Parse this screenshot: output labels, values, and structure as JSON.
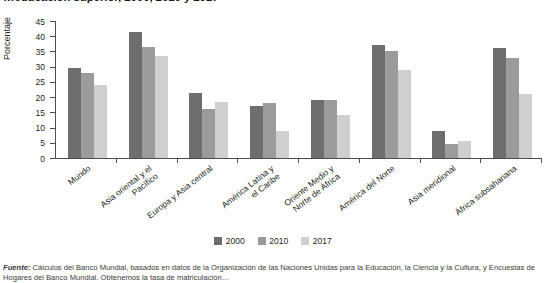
{
  "figure": {
    "title_clipped": "…educación superior, 2000, 2010 y 2017",
    "ylabel": "Porcentaje"
  },
  "legend": {
    "position": "bottom-center",
    "items": [
      {
        "label": "2000",
        "color": "#6e6e6e"
      },
      {
        "label": "2010",
        "color": "#9b9b9b"
      },
      {
        "label": "2017",
        "color": "#cfcfcf"
      }
    ]
  },
  "footnote": {
    "source_label": "Fuente:",
    "text": " Cálculos del Banco Mundial, basados en datos de la Organización de las Naciones Unidas para la Educación, la Ciencia y la Cultura, y",
    "line2": "Encuestas de Hogares del Banco Mundial. Obtenemos la tasa de matriculación…"
  },
  "chart_data": {
    "type": "bar",
    "title": "…educación superior, 2000, 2010 y 2017",
    "xlabel": "",
    "ylabel": "Porcentaje",
    "ylim": [
      0,
      45
    ],
    "yticks": [
      0,
      5,
      10,
      15,
      20,
      25,
      30,
      35,
      40,
      45
    ],
    "grid": false,
    "legend_position": "bottom-center",
    "categories": [
      "Mundo",
      "Asia oriental y el\nPacífico",
      "Europa y Asia central",
      "América Latina y\nel Caribe",
      "Oriente Medio y\nNorte de África",
      "América del Norte",
      "Asia meridional",
      "África subsahariana"
    ],
    "series": [
      {
        "name": "2000",
        "color": "#6e6e6e",
        "values": [
          29.5,
          41.5,
          21.5,
          17.0,
          19.0,
          37.0,
          9.0,
          36.0
        ]
      },
      {
        "name": "2010",
        "color": "#9b9b9b",
        "values": [
          28.0,
          36.5,
          16.0,
          18.0,
          19.0,
          35.0,
          4.5,
          33.0
        ]
      },
      {
        "name": "2017",
        "color": "#cfcfcf",
        "values": [
          24.0,
          33.5,
          18.5,
          9.0,
          14.0,
          29.0,
          5.5,
          21.0
        ]
      }
    ]
  }
}
